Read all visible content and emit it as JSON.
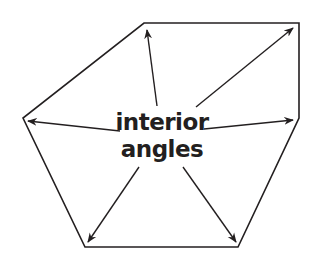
{
  "diagram": {
    "title": "interior angles",
    "label_lines": [
      "interior",
      "angles"
    ],
    "colors": {
      "stroke": "#231f20",
      "background": "#ffffff"
    },
    "polygon": {
      "sides": 6,
      "vertices": [
        [
          144,
          23
        ],
        [
          299,
          23
        ],
        [
          299,
          118
        ],
        [
          238,
          247
        ],
        [
          85,
          247
        ],
        [
          23,
          118
        ]
      ]
    },
    "arrows": [
      {
        "from": [
          157,
          106
        ],
        "to": [
          147,
          30
        ]
      },
      {
        "from": [
          196,
          107
        ],
        "to": [
          293,
          28
        ]
      },
      {
        "from": [
          204,
          129
        ],
        "to": [
          293,
          120
        ]
      },
      {
        "from": [
          183,
          167
        ],
        "to": [
          236,
          242
        ]
      },
      {
        "from": [
          139,
          167
        ],
        "to": [
          88,
          242
        ]
      },
      {
        "from": [
          120,
          131
        ],
        "to": [
          28,
          121
        ]
      }
    ]
  }
}
